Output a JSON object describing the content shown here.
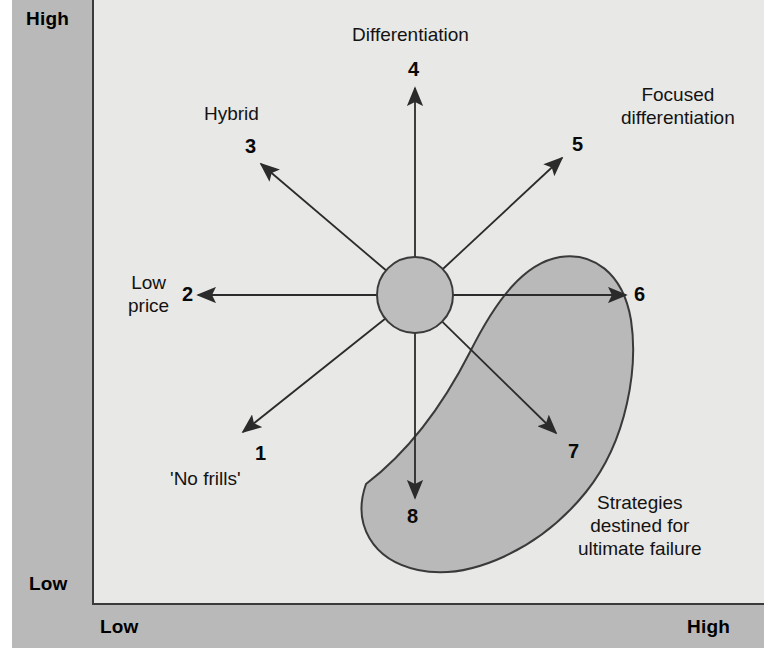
{
  "figure": {
    "type": "strategic-positioning-diagram"
  },
  "axes": {
    "y_high": "High",
    "y_low": "Low",
    "x_low": "Low",
    "x_high": "High"
  },
  "colors": {
    "band": "#b9b9b9",
    "panel": "#e8e8e6",
    "hub": "#bdbdbd",
    "crescent": "#b9b9b9",
    "stroke": "#3a3a3a",
    "text": "#111111"
  },
  "hub": {
    "cx": 415,
    "cy": 295,
    "r": 38
  },
  "spokes": [
    {
      "number": "1",
      "name": "no-frills",
      "label_lines": [
        "'No frills'"
      ],
      "angle_deg": 215,
      "tip": {
        "x": 243,
        "y": 432
      },
      "num_pos": {
        "x": 255,
        "y": 442
      },
      "label_pos": {
        "x": 170,
        "y": 468
      }
    },
    {
      "number": "2",
      "name": "low-price",
      "label_lines": [
        "Low",
        "price"
      ],
      "angle_deg": 180,
      "tip": {
        "x": 198,
        "y": 295
      },
      "num_pos": {
        "x": 182,
        "y": 283
      },
      "label_pos": {
        "x": 128,
        "y": 272
      }
    },
    {
      "number": "3",
      "name": "hybrid",
      "label_lines": [
        "Hybrid"
      ],
      "angle_deg": 140,
      "tip": {
        "x": 261,
        "y": 164
      },
      "num_pos": {
        "x": 245,
        "y": 135
      },
      "label_pos": {
        "x": 204,
        "y": 103
      }
    },
    {
      "number": "4",
      "name": "differentiation",
      "label_lines": [
        "Differentiation"
      ],
      "angle_deg": 90,
      "tip": {
        "x": 415,
        "y": 88
      },
      "num_pos": {
        "x": 408,
        "y": 58
      },
      "label_pos": {
        "x": 352,
        "y": 24
      }
    },
    {
      "number": "5",
      "name": "focused-differentiation",
      "label_lines": [
        "Focused",
        "differentiation"
      ],
      "angle_deg": 42,
      "tip": {
        "x": 562,
        "y": 158
      },
      "num_pos": {
        "x": 572,
        "y": 133
      },
      "label_pos": {
        "x": 621,
        "y": 84
      }
    },
    {
      "number": "6",
      "name": "increased-price-standard-value",
      "label_lines": [],
      "angle_deg": 0,
      "tip": {
        "x": 626,
        "y": 295
      },
      "num_pos": {
        "x": 634,
        "y": 283
      },
      "label_pos": null
    },
    {
      "number": "7",
      "name": "high-price-low-value",
      "label_lines": [],
      "angle_deg": -40,
      "tip": {
        "x": 556,
        "y": 433
      },
      "num_pos": {
        "x": 568,
        "y": 440
      },
      "label_pos": null
    },
    {
      "number": "8",
      "name": "low-value-standard-price",
      "label_lines": [],
      "angle_deg": -90,
      "tip": {
        "x": 415,
        "y": 498
      },
      "num_pos": {
        "x": 407,
        "y": 505
      },
      "label_pos": null
    }
  ],
  "failure_zone": {
    "name": "strategies-destined-for-ultimate-failure",
    "label_lines": [
      "Strategies",
      "destined for",
      "ultimate failure"
    ],
    "label_pos": {
      "x": 578,
      "y": 492
    },
    "path": "M 366 484 C 352 524, 372 560, 418 570 C 470 581, 540 549, 586 492 C 628 440, 638 366, 631 320 C 623 272, 592 252, 560 257 C 524 263, 496 300, 470 352 C 440 411, 404 455, 366 484 Z"
  }
}
